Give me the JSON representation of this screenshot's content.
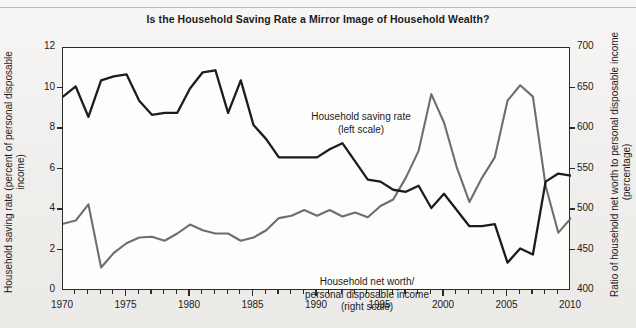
{
  "chart_data": {
    "type": "line",
    "title": "Is the Household Saving Rate a Mirror Image of Household Wealth?",
    "xlabel": "",
    "ylabel": "Household saving rate (percent of personal disposable income)",
    "y2label": "Ratio of household net worth to personal disposable income (percentage)",
    "xlim": [
      1970,
      2010
    ],
    "ylim": [
      0,
      12
    ],
    "y2lim": [
      400,
      700
    ],
    "yticks": [
      0,
      2,
      4,
      6,
      8,
      10,
      12
    ],
    "y2ticks": [
      400,
      450,
      500,
      550,
      600,
      650,
      700
    ],
    "xticks": [
      1970,
      1975,
      1980,
      1985,
      1990,
      1995,
      2000,
      2005,
      2010
    ],
    "xtick_labels": [
      "1970",
      "1975",
      "1980",
      "1985",
      "1990",
      "1995",
      "2000",
      "2005",
      "2010"
    ],
    "minor_xtick_interval": 1,
    "grid": false,
    "legend": "inline-annotations",
    "x": [
      1970,
      1971,
      1972,
      1973,
      1974,
      1975,
      1976,
      1977,
      1978,
      1979,
      1980,
      1981,
      1982,
      1983,
      1984,
      1985,
      1986,
      1987,
      1988,
      1989,
      1990,
      1991,
      1992,
      1993,
      1994,
      1995,
      1996,
      1997,
      1998,
      1999,
      2000,
      2001,
      2002,
      2003,
      2004,
      2005,
      2006,
      2007,
      2008,
      2009,
      2010
    ],
    "series": [
      {
        "name": "Household saving rate",
        "axis": "left",
        "annotation": "Household saving rate\n(left scale)",
        "color": "#1c1c1c",
        "values": [
          9.6,
          10.1,
          8.6,
          10.4,
          10.6,
          10.7,
          9.4,
          8.7,
          8.8,
          8.8,
          10.0,
          10.8,
          10.9,
          8.8,
          10.4,
          8.2,
          7.5,
          6.6,
          6.6,
          6.6,
          6.6,
          7.0,
          7.3,
          6.4,
          5.5,
          5.4,
          5.0,
          4.9,
          5.2,
          4.1,
          4.8,
          4.0,
          3.2,
          3.2,
          3.3,
          1.4,
          2.1,
          1.8,
          5.4,
          5.8,
          5.7
        ]
      },
      {
        "name": "Household net worth/personal disposable income",
        "axis": "right",
        "annotation": "Household net worth/\npersonal disposable income\n(right scale)",
        "color": "#6e6e6e",
        "values": [
          483,
          487,
          507,
          429,
          447,
          459,
          466,
          467,
          462,
          471,
          482,
          475,
          471,
          471,
          462,
          466,
          475,
          490,
          493,
          500,
          493,
          500,
          492,
          497,
          491,
          505,
          513,
          540,
          573,
          643,
          608,
          553,
          510,
          540,
          565,
          635,
          654,
          640,
          530,
          472,
          490
        ]
      }
    ]
  },
  "annotations": {
    "saving_rate": {
      "line1": "Household saving rate",
      "line2": "(left scale)"
    },
    "net_worth": {
      "line1": "Household net worth/",
      "line2": "personal disposable income",
      "line3": "(right scale)"
    }
  },
  "axis_titles": {
    "left_line1": "Household saving rate (percent of personal disposable",
    "left_line2": "income)",
    "right_line1": "Ratio of household net worth to personal disposable income",
    "right_line2": "(percentage)"
  },
  "colors": {
    "saving_rate_line": "#1c1c1c",
    "net_worth_line": "#6e6e6e",
    "axis": "#2a2a2a",
    "background": "#f2f1ef",
    "plot_background": "#fdfdfc"
  }
}
